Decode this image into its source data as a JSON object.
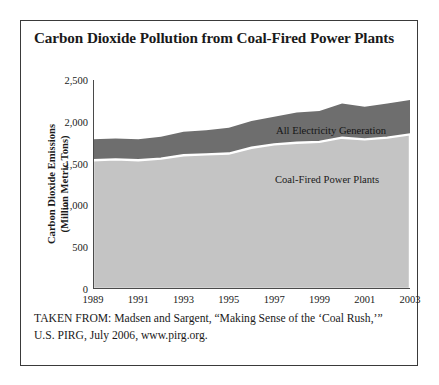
{
  "figure": {
    "title": "Carbon Dioxide Pollution from Coal-Fired Power Plants",
    "source_note": "TAKEN FROM: Madsen and Sargent, “Making Sense of the ‘Coal Rush,’” U.S. PIRG, July 2006, www.pirg.org."
  },
  "chart_data": {
    "type": "area",
    "title": "Carbon Dioxide Pollution from Coal-Fired Power Plants",
    "xlabel": "",
    "ylabel": "Carbon Dioxide Emissions\n(Million Metric Tons)",
    "ylabel_line1": "Carbon Dioxide Emissions",
    "ylabel_line2": "(Million Metric Tons)",
    "x": [
      1989,
      1990,
      1991,
      1992,
      1993,
      1994,
      1995,
      1996,
      1997,
      1998,
      1999,
      2000,
      2001,
      2002,
      2003
    ],
    "xlim": [
      1989,
      2003
    ],
    "ylim": [
      0,
      2500
    ],
    "yticks": [
      0,
      500,
      1000,
      1500,
      2000,
      2500
    ],
    "ytick_labels": [
      "0",
      "500",
      "1,000",
      "1,500",
      "2,000",
      "2,500"
    ],
    "xticks": [
      1989,
      1991,
      1993,
      1995,
      1997,
      1999,
      2001,
      2003
    ],
    "xtick_labels": [
      "1989",
      "1991",
      "1993",
      "1995",
      "1997",
      "1999",
      "2001",
      "2003"
    ],
    "grid": false,
    "stacked": false,
    "legend_position": "inline-annotation",
    "series": [
      {
        "name": "All Electricity Generation",
        "color": "#6e6e6e",
        "values": [
          1790,
          1800,
          1790,
          1820,
          1880,
          1900,
          1930,
          2010,
          2060,
          2110,
          2130,
          2220,
          2180,
          2220,
          2260
        ]
      },
      {
        "name": "Coal-Fired Power Plants",
        "color": "#c4c4c4",
        "values": [
          1540,
          1550,
          1540,
          1560,
          1600,
          1610,
          1620,
          1690,
          1730,
          1750,
          1760,
          1810,
          1790,
          1810,
          1850
        ]
      }
    ],
    "annotations": [
      {
        "text": "All Electricity Generation",
        "x": 1998,
        "y": 2000
      },
      {
        "text": "Coal-Fired Power Plants",
        "x": 1998,
        "y": 1430
      }
    ]
  }
}
